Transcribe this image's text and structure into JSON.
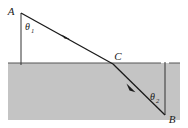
{
  "figure": {
    "type": "physics-ray-diagram",
    "canvas": {
      "width": 188,
      "height": 128,
      "background": "#ffffff"
    },
    "colors": {
      "medium_fill": "#c4c4c4",
      "line": "#1a1a1a",
      "label": "#1a1a1a"
    },
    "labels": {
      "point_a": "A",
      "point_b": "B",
      "point_c": "C",
      "theta1": "θ",
      "theta1_sub": "1",
      "theta2": "θ",
      "theta2_sub": "2"
    },
    "geometry": {
      "point_a": {
        "x": 21,
        "y": 13
      },
      "point_c": {
        "x": 113,
        "y": 64
      },
      "point_b": {
        "x": 165,
        "y": 115
      },
      "normal_top": {
        "x": 21,
        "y": 13,
        "x2": 21,
        "y2": 65
      },
      "normal_bottom": {
        "x": 165,
        "y": 63,
        "x2": 165,
        "y2": 115
      },
      "interface_y": 63,
      "medium_rect": {
        "x": 8,
        "y": 63,
        "width": 172,
        "height": 57
      },
      "arrow_upper": {
        "x": 66,
        "y": 37
      },
      "arrow_lower": {
        "x": 131,
        "y": 88
      }
    },
    "label_positions": {
      "point_a": {
        "x": 11,
        "y": 14
      },
      "theta1": {
        "x": 24,
        "y": 29
      },
      "point_c": {
        "x": 118,
        "y": 59
      },
      "theta2": {
        "x": 150,
        "y": 100
      },
      "point_b": {
        "x": 170,
        "y": 122
      }
    }
  }
}
